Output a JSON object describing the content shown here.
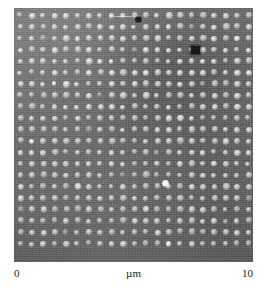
{
  "figure": {
    "type": "micrograph",
    "modality": "scanning-probe-microscopy-image",
    "panel": {
      "x": 14,
      "y": 8,
      "width": 239,
      "height": 254
    },
    "scale": {
      "min_label": "0",
      "unit_label": "µm",
      "max_label": "10",
      "min_value": 0,
      "max_value": 10,
      "unit": "µm"
    },
    "colors": {
      "background_gray": "#6c6c6c",
      "dot_bright": "#f2f2f2",
      "dot_mid": "#d9d9d9",
      "defect_dark": "#151515",
      "page_background": "#ffffff"
    }
  },
  "chart_data": {
    "type": "heatmap",
    "title": "",
    "subtitle": "",
    "xlabel": "µm",
    "ylabel": "",
    "xlim": [
      0,
      10
    ],
    "ylim": [
      0,
      10
    ],
    "grid": false,
    "legend": "none",
    "tick_labels": {
      "x": [
        "0",
        "10"
      ],
      "y": []
    },
    "annotations": [
      {
        "name": "dark-blob-defect",
        "x_um": 5.2,
        "y_um": 9.6,
        "value": "dark contamination particle"
      },
      {
        "name": "scratch-streak",
        "x_um": 4.8,
        "y_um": 9.4,
        "value": "bright horizontal streak artifact"
      },
      {
        "name": "dark-square-defect",
        "x_um": 7.6,
        "y_um": 8.3,
        "value": "missing / recessed lattice site"
      },
      {
        "name": "bright-outlier-dot",
        "x_um": 6.3,
        "y_um": 3.1,
        "value": "anomalously bright lattice site"
      }
    ],
    "lattice": {
      "description": "square periodic array of bright dots",
      "columns": 21,
      "rows": 21,
      "pitch_um": 0.47,
      "pitch_px": 11.4,
      "origin_px": {
        "x": 6.5,
        "y": 7.5
      },
      "dot_diameter_px": 5.6,
      "total_dots": 441
    },
    "defects": [
      {
        "kind": "dark-blob",
        "cx": 124,
        "cy": 11,
        "w": 7,
        "h": 7
      },
      {
        "kind": "scratch",
        "cx": 112,
        "cy": 8,
        "w": 34,
        "h": 1
      },
      {
        "kind": "dark-square",
        "cx": 181,
        "cy": 42,
        "w": 9,
        "h": 8
      },
      {
        "kind": "bright-spot",
        "cx": 151,
        "cy": 175,
        "w": 7,
        "h": 7
      }
    ],
    "bright_sites_px": [
      {
        "col": 3,
        "row": 6
      },
      {
        "col": 8,
        "row": 4
      },
      {
        "col": 14,
        "row": 9
      },
      {
        "col": 17,
        "row": 13
      },
      {
        "col": 5,
        "row": 15
      },
      {
        "col": 11,
        "row": 17
      },
      {
        "col": 19,
        "row": 2
      },
      {
        "col": 1,
        "row": 11
      },
      {
        "col": 13,
        "row": 20
      }
    ],
    "dim_sites_px": [
      {
        "col": 2,
        "row": 2
      },
      {
        "col": 6,
        "row": 10
      },
      {
        "col": 10,
        "row": 3
      },
      {
        "col": 16,
        "row": 6
      },
      {
        "col": 20,
        "row": 16
      },
      {
        "col": 4,
        "row": 19
      },
      {
        "col": 15,
        "row": 1
      },
      {
        "col": 9,
        "row": 14
      },
      {
        "col": 18,
        "row": 18
      },
      {
        "col": 0,
        "row": 17
      },
      {
        "col": 12,
        "row": 12
      },
      {
        "col": 7,
        "row": 7
      }
    ]
  }
}
